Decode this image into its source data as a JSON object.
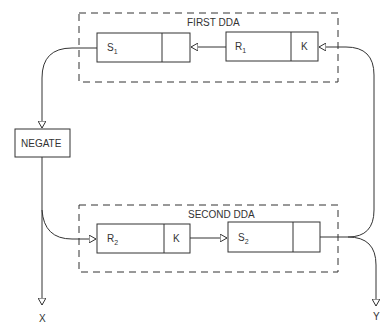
{
  "diagram": {
    "first_dda": {
      "title": "FIRST DDA",
      "s_register": {
        "label": "S",
        "sub": "1"
      },
      "r_register": {
        "label": "R",
        "sub": "1",
        "k": "K"
      }
    },
    "second_dda": {
      "title": "SECOND DDA",
      "r_register": {
        "label": "R",
        "sub": "2",
        "k": "K"
      },
      "s_register": {
        "label": "S",
        "sub": "2"
      }
    },
    "negate": {
      "label": "NEGATE"
    },
    "outputs": {
      "x": "X",
      "y": "Y"
    },
    "colors": {
      "line": "#333333",
      "background": "#ffffff"
    }
  }
}
